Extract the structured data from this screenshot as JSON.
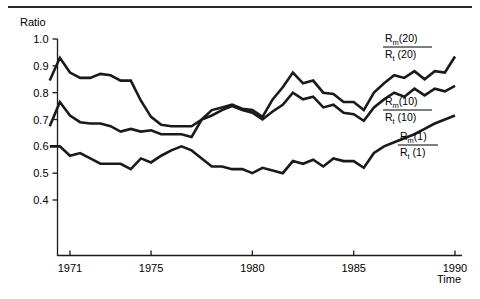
{
  "figure": {
    "has_top_rule": true,
    "background_color": "#ffffff",
    "line_color": "#1a1a1a"
  },
  "chart_data": {
    "type": "line",
    "title": "",
    "subtitle": "",
    "xlabel": "Time",
    "ylabel": "Ratio",
    "xlim": [
      1969.5,
      1990.5
    ],
    "ylim": [
      0.35,
      1.02
    ],
    "grid": false,
    "legend_position": "right-inline",
    "xticks": [
      1971,
      1975,
      1980,
      1985,
      1990
    ],
    "xtick_labels": [
      "1971",
      "1975",
      "1980",
      "1985",
      "1990"
    ],
    "yticks": [
      0.4,
      0.5,
      0.6,
      0.7,
      0.8,
      0.9,
      1.0
    ],
    "ytick_labels": [
      "0.4",
      "0.5",
      "0.6",
      "0.7",
      "0.8",
      "0.9",
      "1.0"
    ],
    "x": [
      1970,
      1970.5,
      1971,
      1971.5,
      1972,
      1972.5,
      1973,
      1973.5,
      1974,
      1974.5,
      1975,
      1975.5,
      1976,
      1976.5,
      1977,
      1977.5,
      1978,
      1978.5,
      1979,
      1979.5,
      1980,
      1980.5,
      1981,
      1981.5,
      1982,
      1982.5,
      1983,
      1983.5,
      1984,
      1984.5,
      1985,
      1985.5,
      1986,
      1986.5,
      1987,
      1987.5,
      1988,
      1988.5,
      1989,
      1989.5,
      1990
    ],
    "series": [
      {
        "name": "Rm(20)/Rt(20)",
        "legend_numerator": "R",
        "legend_numerator_sub": "m",
        "legend_numerator_arg": "(20)",
        "legend_denominator": "R",
        "legend_denominator_sub": "t",
        "legend_denominator_arg": "(20)",
        "values": [
          0.845,
          0.93,
          0.875,
          0.855,
          0.855,
          0.87,
          0.865,
          0.845,
          0.845,
          0.77,
          0.71,
          0.68,
          0.675,
          0.675,
          0.675,
          0.7,
          0.735,
          0.745,
          0.755,
          0.74,
          0.735,
          0.71,
          0.775,
          0.82,
          0.875,
          0.835,
          0.845,
          0.8,
          0.795,
          0.765,
          0.765,
          0.735,
          0.8,
          0.835,
          0.865,
          0.855,
          0.88,
          0.85,
          0.88,
          0.875,
          0.935
        ]
      },
      {
        "name": "Rm(10)/Rt(10)",
        "legend_numerator": "R",
        "legend_numerator_sub": "m",
        "legend_numerator_arg": "(10)",
        "legend_denominator": "R",
        "legend_denominator_sub": "t",
        "legend_denominator_arg": "(10)",
        "values": [
          0.675,
          0.765,
          0.715,
          0.69,
          0.685,
          0.685,
          0.675,
          0.655,
          0.665,
          0.655,
          0.66,
          0.645,
          0.645,
          0.645,
          0.635,
          0.7,
          0.715,
          0.735,
          0.75,
          0.735,
          0.725,
          0.7,
          0.73,
          0.755,
          0.8,
          0.775,
          0.785,
          0.745,
          0.755,
          0.725,
          0.72,
          0.695,
          0.745,
          0.775,
          0.8,
          0.785,
          0.815,
          0.79,
          0.815,
          0.805,
          0.825
        ]
      },
      {
        "name": "Rm(1)/Rt(1)",
        "legend_numerator": "R",
        "legend_numerator_sub": "m",
        "legend_numerator_arg": "(1)",
        "legend_denominator": "R",
        "legend_denominator_sub": "t",
        "legend_denominator_arg": "(1)",
        "values": [
          0.6,
          0.6,
          0.565,
          0.575,
          0.555,
          0.535,
          0.535,
          0.535,
          0.515,
          0.555,
          0.54,
          0.565,
          0.585,
          0.6,
          0.585,
          0.555,
          0.525,
          0.525,
          0.515,
          0.515,
          0.5,
          0.52,
          0.51,
          0.5,
          0.545,
          0.535,
          0.55,
          0.525,
          0.555,
          0.545,
          0.545,
          0.52,
          0.575,
          0.6,
          0.615,
          0.63,
          0.645,
          0.665,
          0.685,
          0.7,
          0.715
        ]
      }
    ]
  }
}
